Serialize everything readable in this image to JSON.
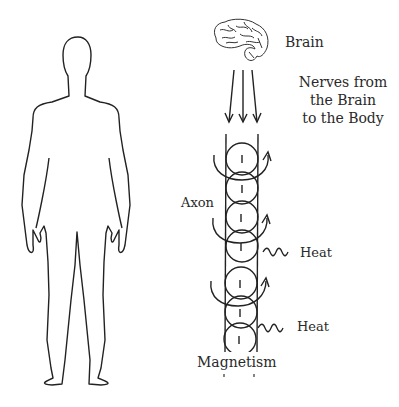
{
  "diagram": {
    "labels": {
      "brain": "Brain",
      "nerves_line1": "Nerves from",
      "nerves_line2": "the Brain",
      "nerves_line3": "to the Body",
      "axon": "Axon",
      "heat_1": "Heat",
      "heat_2": "Heat",
      "magnetism": "Magnetism"
    },
    "icons": [
      "human-body-outline",
      "brain-icon",
      "down-arrow-icon",
      "curved-arrow-icon",
      "wavy-heat-icon"
    ],
    "column": {
      "circles": 6
    },
    "colors": {
      "line": "#222222",
      "background": "#ffffff"
    }
  }
}
